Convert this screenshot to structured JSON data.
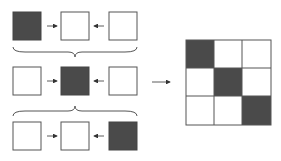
{
  "diagram": {
    "colors": {
      "filled": "#4a4a4a",
      "empty": "#ffffff",
      "stroke": "#555555"
    },
    "rows": [
      {
        "filled_index": 0
      },
      {
        "filled_index": 1
      },
      {
        "filled_index": 2
      }
    ],
    "grid": {
      "size": 3,
      "filled_cells": [
        [
          0,
          0
        ],
        [
          1,
          1
        ],
        [
          2,
          2
        ]
      ]
    }
  }
}
